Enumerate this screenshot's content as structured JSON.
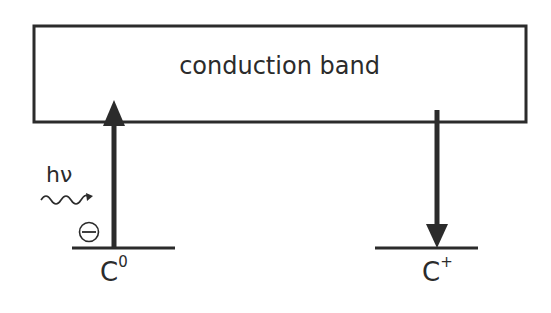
{
  "diagram": {
    "band": {
      "label": "conduction band"
    },
    "photon": {
      "label": "hν",
      "icon": "wavy-arrow-icon"
    },
    "electron": {
      "icon": "minus-circle-icon",
      "charge": "−"
    },
    "levels": [
      {
        "base": "C",
        "superscript": "0",
        "transition": "up (excitation into band)"
      },
      {
        "base": "C",
        "superscript": "+",
        "transition": "down (capture from band)"
      }
    ],
    "colors": {
      "stroke": "#2b2b2b",
      "background": "#ffffff"
    }
  }
}
